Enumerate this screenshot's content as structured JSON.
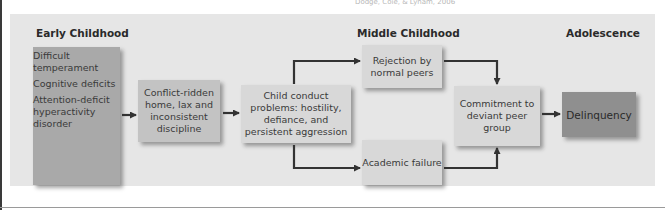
{
  "caption": "Dodge, Coie, & Lynam, 2006",
  "stages": {
    "early": "Early Childhood",
    "middle": "Middle Childhood",
    "adolescence": "Adolescence"
  },
  "nodes": {
    "early_factors": [
      "Difficult temperament",
      "Cognitive deficits",
      "Attention-deficit hyperactivity disorder"
    ],
    "home": "Conflict-ridden home, lax and inconsistent discipline",
    "conduct": "Child conduct problems: hostility, defiance, and persistent aggression",
    "rejection": "Rejection by normal peers",
    "academic": "Academic failure",
    "commitment": "Commitment to deviant peer group",
    "delinquency": "Delinquency"
  },
  "edges": [
    {
      "from": "early_factors",
      "to": "home"
    },
    {
      "from": "home",
      "to": "conduct"
    },
    {
      "from": "conduct",
      "to": "rejection"
    },
    {
      "from": "conduct",
      "to": "academic"
    },
    {
      "from": "rejection",
      "to": "commitment"
    },
    {
      "from": "academic",
      "to": "commitment"
    },
    {
      "from": "commitment",
      "to": "delinquency"
    }
  ],
  "colors": {
    "panel": "#e6e6e6",
    "early_box": "#a9a9a9",
    "mid_box": "#c3c3c3",
    "light_box": "#d8d8d8",
    "delinquency_box": "#8f8f8f",
    "arrow": "#333333"
  }
}
